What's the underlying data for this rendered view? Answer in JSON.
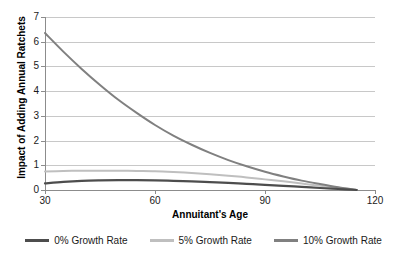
{
  "chart_data": {
    "type": "line",
    "title": "",
    "xlabel": "Annuitant's Age",
    "ylabel": "Impact of Adding Annual Ratchets",
    "xlim": [
      30,
      120
    ],
    "ylim": [
      0,
      7
    ],
    "grid": true,
    "legend_position": "bottom",
    "xticks": [
      "30",
      "60",
      "90",
      "120"
    ],
    "yticks": [
      "0",
      "1",
      "2",
      "3",
      "4",
      "5",
      "6",
      "7"
    ],
    "x": [
      30,
      35,
      40,
      45,
      50,
      55,
      60,
      65,
      70,
      75,
      80,
      85,
      90,
      95,
      100,
      105,
      110,
      115
    ],
    "series": [
      {
        "name": "0% Growth Rate",
        "color": "#4d4d4d",
        "values": [
          0.27,
          0.33,
          0.37,
          0.39,
          0.4,
          0.4,
          0.39,
          0.37,
          0.35,
          0.32,
          0.29,
          0.25,
          0.21,
          0.17,
          0.13,
          0.08,
          0.04,
          0.0
        ]
      },
      {
        "name": "5% Growth Rate",
        "color": "#bfbfbf",
        "values": [
          0.75,
          0.77,
          0.78,
          0.78,
          0.78,
          0.77,
          0.76,
          0.73,
          0.69,
          0.64,
          0.58,
          0.51,
          0.43,
          0.35,
          0.26,
          0.17,
          0.09,
          0.0
        ]
      },
      {
        "name": "10% Growth Rate",
        "color": "#808080",
        "values": [
          6.35,
          5.6,
          4.9,
          4.25,
          3.65,
          3.12,
          2.63,
          2.2,
          1.83,
          1.5,
          1.21,
          0.96,
          0.74,
          0.55,
          0.38,
          0.24,
          0.11,
          0.0
        ]
      }
    ]
  },
  "axis": {
    "y_title": "Impact of Adding Annual Ratchets",
    "x_title": "Annuitant's Age",
    "y_labels": [
      "7",
      "6",
      "5",
      "4",
      "3",
      "2",
      "1",
      "0"
    ],
    "x_labels": [
      "30",
      "60",
      "90",
      "120"
    ]
  },
  "legend": {
    "items": [
      {
        "label": "0% Growth Rate",
        "color": "#4d4d4d"
      },
      {
        "label": "5% Growth Rate",
        "color": "#bfbfbf"
      },
      {
        "label": "10% Growth Rate",
        "color": "#808080"
      }
    ]
  },
  "colors": {
    "background": "#ffffff",
    "gridline": "#c8c8c8",
    "axis": "#8c8c8c",
    "text": "#1a1a1a"
  }
}
